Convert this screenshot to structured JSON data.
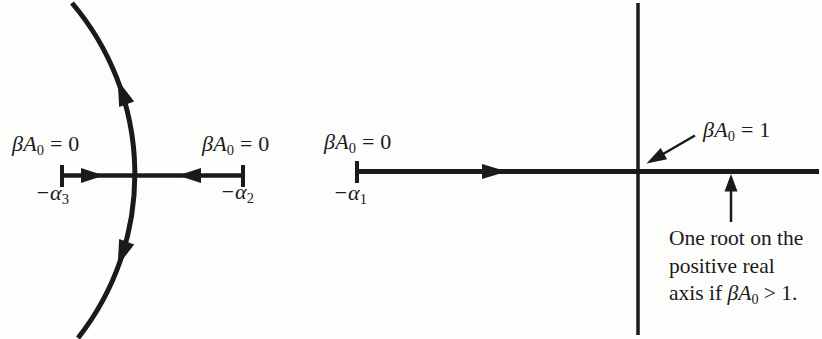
{
  "colors": {
    "ink": "#1a1a1a",
    "background": "#fdfdfb"
  },
  "left_locus": {
    "gain_left": {
      "math": "βA",
      "sub": "0",
      "rest": " = 0"
    },
    "gain_right": {
      "math": "βA",
      "sub": "0",
      "rest": " = 0"
    },
    "pole_alpha3": {
      "math": "−α",
      "sub": "3"
    },
    "pole_alpha2": {
      "math": "−α",
      "sub": "2"
    }
  },
  "right_locus": {
    "gain_zero": {
      "math": "βA",
      "sub": "0",
      "rest": " = 0"
    },
    "gain_one": {
      "math": "βA",
      "sub": "0",
      "rest": " = 1"
    },
    "pole_alpha1": {
      "math": "−α",
      "sub": "1"
    },
    "annotation": {
      "line1": "One root on the",
      "line2": "positive real",
      "line3_pre": "axis if ",
      "line3_math": "βA",
      "line3_sub": "0",
      "line3_post": " > 1."
    }
  }
}
